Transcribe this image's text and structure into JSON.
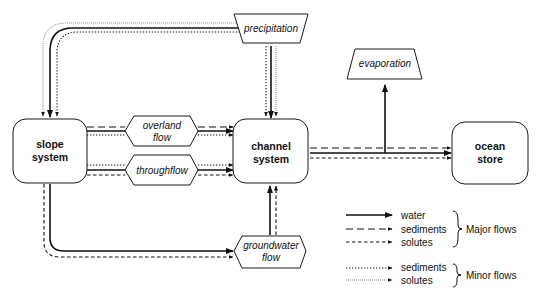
{
  "diagram": {
    "nodes": {
      "slope": {
        "line1": "slope",
        "line2": "system"
      },
      "channel": {
        "line1": "channel",
        "line2": "system"
      },
      "ocean": {
        "line1": "ocean",
        "line2": "store"
      },
      "precipitation": {
        "label": "precipitation"
      },
      "evaporation": {
        "label": "evaporation"
      },
      "overland": {
        "line1": "overland",
        "line2": "flow"
      },
      "throughflow": {
        "label": "throughflow"
      },
      "groundwater": {
        "line1": "groundwater",
        "line2": "flow"
      }
    },
    "edges": [
      {
        "from": "precipitation",
        "to": "slope system",
        "types": [
          "water",
          "minor sediments",
          "minor solutes"
        ]
      },
      {
        "from": "precipitation",
        "to": "channel system",
        "types": [
          "water",
          "minor sediments",
          "minor solutes"
        ]
      },
      {
        "from": "slope system",
        "to": "channel system",
        "via": "overland flow",
        "types": [
          "water",
          "sediments",
          "minor sediments"
        ]
      },
      {
        "from": "slope system",
        "to": "channel system",
        "via": "throughflow",
        "types": [
          "water",
          "solutes",
          "minor sediments"
        ]
      },
      {
        "from": "slope system",
        "to": "channel system",
        "via": "groundwater flow",
        "types": [
          "water",
          "solutes"
        ]
      },
      {
        "from": "channel system",
        "to": "ocean store",
        "types": [
          "water",
          "sediments",
          "solutes"
        ]
      },
      {
        "from": "channel-ocean flow",
        "to": "evaporation",
        "types": [
          "water"
        ]
      }
    ]
  },
  "legend": {
    "major": {
      "items": [
        {
          "style": "solid",
          "label": "water"
        },
        {
          "style": "long-dash",
          "label": "sediments"
        },
        {
          "style": "short-dash",
          "label": "solutes"
        }
      ],
      "group_label": "Major flows"
    },
    "minor": {
      "items": [
        {
          "style": "dotted-heavy",
          "label": "sediments"
        },
        {
          "style": "dotted-fine",
          "label": "solutes"
        }
      ],
      "group_label": "Minor flows"
    }
  }
}
